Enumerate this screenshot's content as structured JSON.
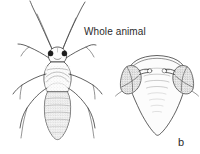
{
  "figure": {
    "background_color": "#ffffff",
    "ink_color": "#2e2e2e",
    "width": 200,
    "height": 154,
    "caption": "Whole animal",
    "panel_label": "b",
    "panels": [
      {
        "id": "panel-a",
        "name": "whole-animal-dorsal-view",
        "caption": "Whole animal",
        "description": "Dorsal line drawing of an insect with two long antennae, two dark compound eyes, segmented thorax with chevron markings, stippled segmented abdomen and three pairs of legs.",
        "parts": [
          "antenna-left",
          "antenna-right",
          "eye-left",
          "eye-right",
          "head",
          "thorax",
          "abdomen",
          "foreleg-left",
          "foreleg-right",
          "midleg-left",
          "midleg-right",
          "hindleg-left",
          "hindleg-right"
        ]
      },
      {
        "id": "panel-b",
        "name": "abdomen-detail-view",
        "label": "b",
        "description": "Enlarged triangular abdomen detail with two stippled lateral lobes bearing short stalked projections and faint transverse segment lines along the midline.",
        "parts": [
          "abdomen-outline",
          "lobe-left",
          "lobe-right",
          "stalk-left",
          "stalk-right",
          "segment-lines"
        ]
      }
    ]
  }
}
